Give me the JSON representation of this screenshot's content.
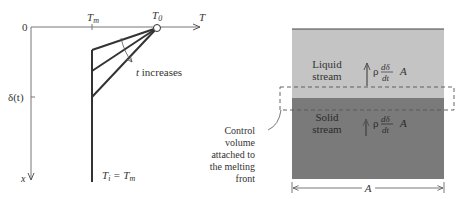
{
  "left_diagram": {
    "origin_label": "0",
    "x_axis_label": "T",
    "y_axis_label": "x",
    "tick_tm_label": "T",
    "tick_tm_sub": "m",
    "t0_label": "T",
    "t0_sub": "0",
    "delta_label": "δ(t)",
    "arrow_label": "t increases",
    "bottom_label_main": "T",
    "bottom_label_sub1": "i",
    "bottom_label_eq": " = T",
    "bottom_label_sub2": "m",
    "colors": {
      "line": "#3a3a3a",
      "axis": "#777777"
    }
  },
  "right_diagram": {
    "liquid_label_line1": "Liquid",
    "liquid_label_line2": "stream",
    "solid_label_line1": "Solid",
    "solid_label_line2": "stream",
    "flux_rho": "ρ",
    "flux_num": "dδ",
    "flux_den": "dt",
    "flux_area": "A",
    "control_volume_lines": [
      "Control",
      "volume",
      "attached to",
      "the melting",
      "front"
    ],
    "width_label": "A",
    "colors": {
      "liquid": "#c4c4c4",
      "solid": "#7a7a7a",
      "dash": "#555555"
    }
  }
}
